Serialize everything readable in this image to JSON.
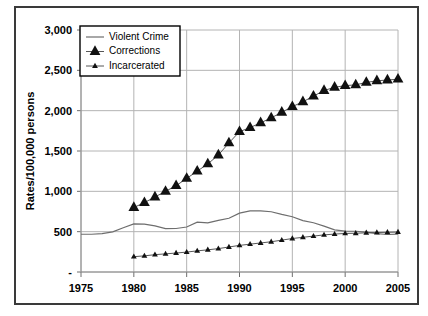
{
  "chart_data": {
    "type": "line",
    "title": "",
    "xlabel": "",
    "ylabel": "Rates/100,000 persons",
    "xlim": [
      1975,
      2005
    ],
    "ylim": [
      0,
      3000
    ],
    "grid": true,
    "legend_position": "top-left",
    "xticks": [
      "1975",
      "1980",
      "1985",
      "1990",
      "1995",
      "2000",
      "2005"
    ],
    "xtick_values": [
      1975,
      1980,
      1985,
      1990,
      1995,
      2000,
      2005
    ],
    "yticks": [
      "-",
      "500",
      "1,000",
      "1,500",
      "2,000",
      "2,500",
      "3,000"
    ],
    "ytick_values": [
      0,
      500,
      1000,
      1500,
      2000,
      2500,
      3000
    ],
    "series": [
      {
        "name": "Violent Crime",
        "marker": "none",
        "x": [
          1975,
          1976,
          1977,
          1978,
          1979,
          1980,
          1981,
          1982,
          1983,
          1984,
          1985,
          1986,
          1987,
          1988,
          1989,
          1990,
          1991,
          1992,
          1993,
          1994,
          1995,
          1996,
          1997,
          1998,
          1999,
          2000,
          2001,
          2002,
          2003,
          2004,
          2005
        ],
        "values": [
          468,
          468,
          476,
          498,
          549,
          597,
          594,
          571,
          538,
          539,
          558,
          618,
          610,
          640,
          666,
          730,
          758,
          758,
          747,
          714,
          685,
          637,
          611,
          568,
          523,
          507,
          505,
          495,
          476,
          465,
          469
        ]
      },
      {
        "name": "Corrections",
        "marker": "triangle-large",
        "x": [
          1980,
          1981,
          1982,
          1983,
          1984,
          1985,
          1986,
          1987,
          1988,
          1989,
          1990,
          1991,
          1992,
          1993,
          1994,
          1995,
          1996,
          1997,
          1998,
          1999,
          2000,
          2001,
          2002,
          2003,
          2004,
          2005
        ],
        "values": [
          800,
          860,
          930,
          1000,
          1070,
          1160,
          1250,
          1340,
          1450,
          1600,
          1740,
          1790,
          1850,
          1910,
          1980,
          2050,
          2110,
          2180,
          2250,
          2290,
          2310,
          2320,
          2350,
          2370,
          2380,
          2390
        ]
      },
      {
        "name": "Incarcerated",
        "marker": "triangle-small",
        "x": [
          1980,
          1981,
          1982,
          1983,
          1984,
          1985,
          1986,
          1987,
          1988,
          1989,
          1990,
          1991,
          1992,
          1993,
          1994,
          1995,
          1996,
          1997,
          1998,
          1999,
          2000,
          2001,
          2002,
          2003,
          2004,
          2005
        ],
        "values": [
          190,
          200,
          215,
          225,
          235,
          247,
          262,
          275,
          290,
          310,
          330,
          345,
          360,
          375,
          395,
          415,
          430,
          445,
          460,
          470,
          478,
          480,
          486,
          489,
          492,
          495
        ]
      }
    ]
  },
  "legend": {
    "items": [
      {
        "label": "Violent Crime"
      },
      {
        "label": "Corrections"
      },
      {
        "label": "Incarcerated"
      }
    ]
  },
  "colors": {
    "violent_crime": "#6e6e6e",
    "corrections": "#111111",
    "incarcerated": "#111111",
    "grid": "#b4b4b4",
    "frame": "#3a3a3a"
  }
}
